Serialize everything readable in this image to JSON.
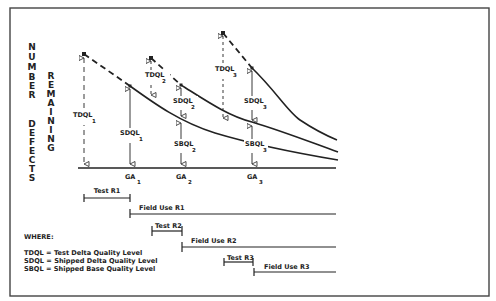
{
  "y_axis_label": {
    "column1": [
      "N",
      "U",
      "M",
      "B",
      "E",
      "R",
      "",
      "D",
      "E",
      "F",
      "E",
      "C",
      "T",
      "S"
    ],
    "column1_words": [
      "NUMBER",
      "DEFECTS"
    ],
    "column2_word": "REMAINING",
    "column2": [
      "R",
      "E",
      "M",
      "A",
      "I",
      "N",
      "I",
      "N",
      "G"
    ]
  },
  "annotations": {
    "tdql1": {
      "main": "TDQL",
      "sub": "1"
    },
    "tdql2": {
      "main": "TDQL",
      "sub": "2"
    },
    "tdql3": {
      "main": "TDQL",
      "sub": "3"
    },
    "sdql1": {
      "main": "SDQL",
      "sub": "1"
    },
    "sdql2": {
      "main": "SDQL",
      "sub": "2"
    },
    "sdql3": {
      "main": "SDQL",
      "sub": "3"
    },
    "sbql2": {
      "main": "SBQL",
      "sub": "2"
    },
    "sbql3": {
      "main": "SBQL",
      "sub": "3"
    }
  },
  "x_axis": {
    "ga1": {
      "main": "GA",
      "sub": "1"
    },
    "ga2": {
      "main": "GA",
      "sub": "2"
    },
    "ga3": {
      "main": "GA",
      "sub": "3"
    }
  },
  "timeline": {
    "test_r1": "Test R1",
    "field_use_r1": "Field Use R1",
    "test_r2": "Test R2",
    "field_use_r2": "Field Use R2",
    "test_r3": "Test R3",
    "field_use_r3": "Field Use R3"
  },
  "legend": {
    "title": "WHERE:",
    "items": [
      "TDQL = Test Delta Quality Level",
      "SDQL = Shipped Delta Quality Level",
      "SBQL = Shipped Base Quality Level"
    ]
  },
  "colors": {
    "ink": "#222222",
    "frame": "#444444",
    "background": "#ffffff"
  }
}
